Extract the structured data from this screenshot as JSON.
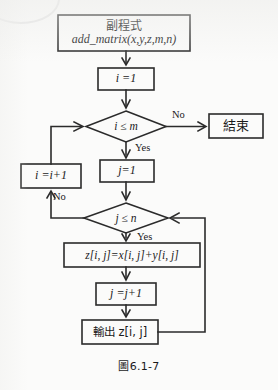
{
  "figure": {
    "caption": "圖6.1-7",
    "caption_number": "6.1-7"
  },
  "flowchart": {
    "type": "flowchart",
    "title": "副程式 add_matrix(x,y,z,m,n)",
    "nodes": [
      {
        "id": "start",
        "shape": "process",
        "line1": "副程式",
        "line2": "add_matrix(x,y,z,m,n)"
      },
      {
        "id": "init_i",
        "shape": "process",
        "text": "i =1"
      },
      {
        "id": "cond_i",
        "shape": "decision",
        "text": "i ≤ m"
      },
      {
        "id": "end",
        "shape": "process",
        "text": "結束"
      },
      {
        "id": "init_j",
        "shape": "process",
        "text": "j=1"
      },
      {
        "id": "inc_i",
        "shape": "process",
        "text": "i =i+1"
      },
      {
        "id": "cond_j",
        "shape": "decision",
        "text": "j ≤ n"
      },
      {
        "id": "assign_z",
        "shape": "process",
        "text": "z[i, j]=x[i, j]+y[i, j]"
      },
      {
        "id": "inc_j",
        "shape": "process",
        "text": "j =j+1"
      },
      {
        "id": "output",
        "shape": "process",
        "text": "輸出 z[i, j]"
      }
    ],
    "edge_labels": {
      "cond_i_no": "No",
      "cond_i_yes": "Yes",
      "cond_j_no": "No",
      "cond_j_yes": "Yes"
    },
    "colors": {
      "stroke": "#2b2b2b",
      "background": "#fbfbfa",
      "text": "#1a1a1a"
    }
  }
}
